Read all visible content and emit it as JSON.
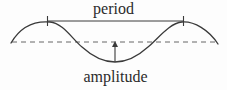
{
  "figure": {
    "type": "wave-diagram",
    "title": "",
    "background_color": "#fdfdfd",
    "stroke_color": "#3a3a3a",
    "text_color": "#2b2b2b"
  },
  "labels": {
    "period": "period",
    "amplitude": "amplitude"
  },
  "chart_data": {
    "type": "line",
    "title": "",
    "xlabel": "",
    "ylabel": "",
    "grid": false,
    "legend": null,
    "xlim": [
      11,
      218
    ],
    "ylim": [
      22,
      63
    ],
    "annotations": [
      {
        "name": "period",
        "text": "period",
        "kind": "horizontal-measure",
        "x_start": 47,
        "x_end": 183,
        "y": 21,
        "tick_marks": [
          47,
          183
        ],
        "label_x": 113,
        "label_y": 9
      },
      {
        "name": "amplitude",
        "text": "amplitude",
        "kind": "vertical-arrow",
        "x": 115,
        "y_start": 62,
        "y_end": 42,
        "arrow_head": "up",
        "label_x": 115,
        "label_y": 77
      }
    ],
    "baseline": {
      "name": "equilibrium-line",
      "style": "dashed",
      "y": 42,
      "x_start": 12,
      "x_end": 218
    },
    "curve": {
      "name": "sine-wave",
      "style": "solid",
      "peaks": [
        {
          "x": 50,
          "y": 22
        },
        {
          "x": 182,
          "y": 22
        }
      ],
      "troughs": [
        {
          "x": 115,
          "y": 62
        }
      ],
      "zero_crossings": [
        82,
        148
      ],
      "start_point": {
        "x": 11,
        "y": 43
      },
      "end_point": {
        "x": 218,
        "y": 44
      },
      "path": "M 11 43 C 22 24, 38 21, 50 22 C 63 23, 73 40, 82 47 C 93 57, 105 62, 115 62 C 126 62, 137 57, 148 47 C 157 40, 169 23, 182 22 C 194 21, 209 30, 218 44"
    }
  }
}
